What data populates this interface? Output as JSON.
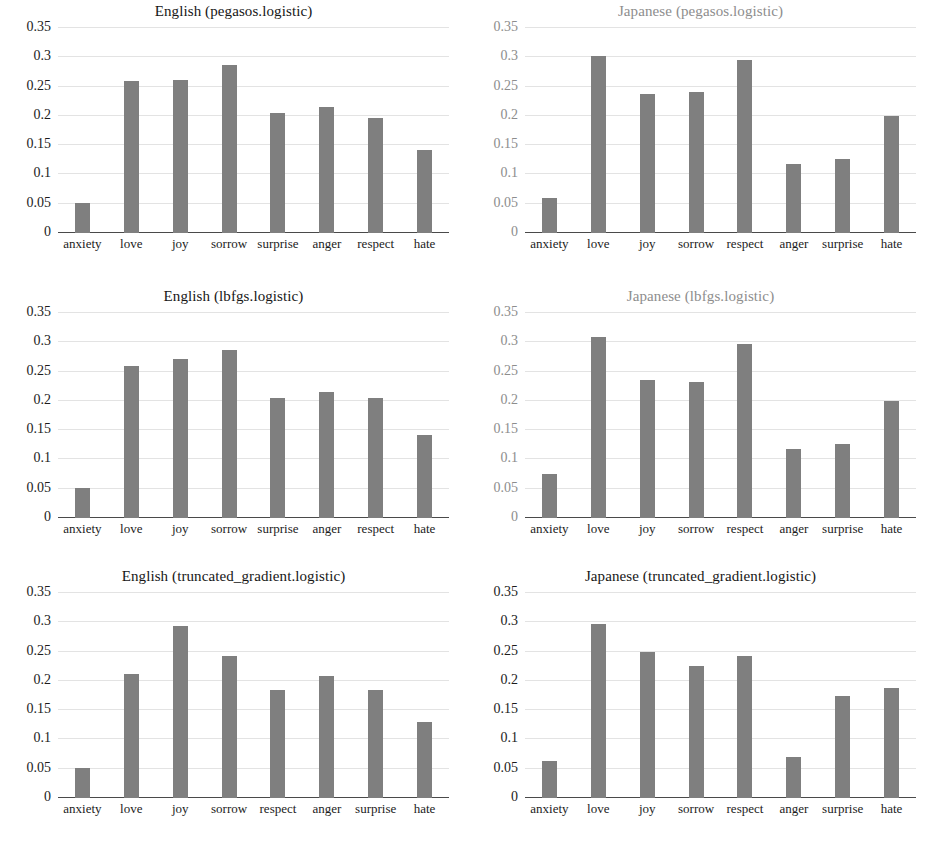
{
  "figure": {
    "panel_count": 6,
    "bar_color": "#7f7f7f",
    "gridline_color": "#e3e3e3",
    "axis_color": "#4a4a4a",
    "background": "#ffffff"
  },
  "chart_data": [
    {
      "type": "bar",
      "title": "English (pegasos.logistic)",
      "categories": [
        "anxiety",
        "love",
        "joy",
        "sorrow",
        "surprise",
        "anger",
        "respect",
        "hate"
      ],
      "values": [
        0.052,
        0.26,
        0.261,
        0.287,
        0.205,
        0.216,
        0.196,
        0.141
      ],
      "xlabel": "",
      "ylabel": "",
      "ylim": [
        0,
        0.35
      ],
      "yticks": [
        0,
        0.05,
        0.1,
        0.15,
        0.2,
        0.25,
        0.3,
        0.35
      ],
      "ytick_labels": [
        "0",
        "0.05",
        "0.1",
        "0.15",
        "0.2",
        "0.25",
        "0.3",
        "0.35"
      ],
      "grid": true,
      "legend": "none",
      "faded": false
    },
    {
      "type": "bar",
      "title": "Japanese (pegasos.logistic)",
      "categories": [
        "anxiety",
        "love",
        "joy",
        "sorrow",
        "respect",
        "anger",
        "surprise",
        "hate"
      ],
      "values": [
        0.06,
        0.303,
        0.237,
        0.24,
        0.296,
        0.118,
        0.127,
        0.2
      ],
      "xlabel": "",
      "ylabel": "",
      "ylim": [
        0,
        0.35
      ],
      "yticks": [
        0,
        0.05,
        0.1,
        0.15,
        0.2,
        0.25,
        0.3,
        0.35
      ],
      "ytick_labels": [
        "0",
        "0.05",
        "0.1",
        "0.15",
        "0.2",
        "0.25",
        "0.3",
        "0.35"
      ],
      "grid": true,
      "legend": "none",
      "faded": true
    },
    {
      "type": "bar",
      "title": "English (lbfgs.logistic)",
      "categories": [
        "anxiety",
        "love",
        "joy",
        "sorrow",
        "surprise",
        "anger",
        "respect",
        "hate"
      ],
      "values": [
        0.052,
        0.26,
        0.272,
        0.287,
        0.205,
        0.216,
        0.205,
        0.141
      ],
      "xlabel": "",
      "ylabel": "",
      "ylim": [
        0,
        0.35
      ],
      "yticks": [
        0,
        0.05,
        0.1,
        0.15,
        0.2,
        0.25,
        0.3,
        0.35
      ],
      "ytick_labels": [
        "0",
        "0.05",
        "0.1",
        "0.15",
        "0.2",
        "0.25",
        "0.3",
        "0.35"
      ],
      "grid": true,
      "legend": "none",
      "faded": false
    },
    {
      "type": "bar",
      "title": "Japanese (lbfgs.logistic)",
      "categories": [
        "anxiety",
        "love",
        "joy",
        "sorrow",
        "respect",
        "anger",
        "surprise",
        "hate"
      ],
      "values": [
        0.075,
        0.309,
        0.236,
        0.233,
        0.297,
        0.118,
        0.126,
        0.2
      ],
      "xlabel": "",
      "ylabel": "",
      "ylim": [
        0,
        0.35
      ],
      "yticks": [
        0,
        0.05,
        0.1,
        0.15,
        0.2,
        0.25,
        0.3,
        0.35
      ],
      "ytick_labels": [
        "0",
        "0.05",
        "0.1",
        "0.15",
        "0.2",
        "0.25",
        "0.3",
        "0.35"
      ],
      "grid": true,
      "legend": "none",
      "faded": true
    },
    {
      "type": "bar",
      "title": "English (truncated_gradient.logistic)",
      "categories": [
        "anxiety",
        "love",
        "joy",
        "sorrow",
        "respect",
        "anger",
        "surprise",
        "hate"
      ],
      "values": [
        0.052,
        0.212,
        0.294,
        0.242,
        0.184,
        0.209,
        0.185,
        0.129
      ],
      "xlabel": "",
      "ylabel": "",
      "ylim": [
        0,
        0.35
      ],
      "yticks": [
        0,
        0.05,
        0.1,
        0.15,
        0.2,
        0.25,
        0.3,
        0.35
      ],
      "ytick_labels": [
        "0",
        "0.05",
        "0.1",
        "0.15",
        "0.2",
        "0.25",
        "0.3",
        "0.35"
      ],
      "grid": true,
      "legend": "none",
      "faded": false
    },
    {
      "type": "bar",
      "title": "Japanese (truncated_gradient.logistic)",
      "categories": [
        "anxiety",
        "love",
        "joy",
        "sorrow",
        "respect",
        "anger",
        "surprise",
        "hate"
      ],
      "values": [
        0.063,
        0.297,
        0.25,
        0.225,
        0.242,
        0.07,
        0.175,
        0.188
      ],
      "xlabel": "",
      "ylabel": "",
      "ylim": [
        0,
        0.35
      ],
      "yticks": [
        0,
        0.05,
        0.1,
        0.15,
        0.2,
        0.25,
        0.3,
        0.35
      ],
      "ytick_labels": [
        "0",
        "0.05",
        "0.1",
        "0.15",
        "0.2",
        "0.25",
        "0.3",
        "0.35"
      ],
      "grid": true,
      "legend": "none",
      "faded": false
    }
  ]
}
